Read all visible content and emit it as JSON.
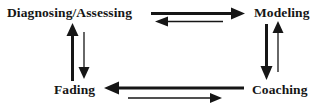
{
  "diagram": {
    "title": "",
    "type": "cycle-diagram",
    "background_color": "#ffffff",
    "ink_color": "#161616",
    "nodes": [
      {
        "id": "diagnosing",
        "label": "Diagnosing/Assessing",
        "position": "top-left"
      },
      {
        "id": "modeling",
        "label": "Modeling",
        "position": "top-right"
      },
      {
        "id": "coaching",
        "label": "Coaching",
        "position": "bottom-right"
      },
      {
        "id": "fading",
        "label": "Fading",
        "position": "bottom-left"
      }
    ],
    "edges": [
      {
        "id": "top-forward",
        "from": "diagnosing",
        "to": "modeling",
        "direction": "right",
        "weight": "thick",
        "side": "top"
      },
      {
        "id": "top-reverse",
        "from": "modeling",
        "to": "diagnosing",
        "direction": "left",
        "weight": "thin",
        "side": "top"
      },
      {
        "id": "right-forward",
        "from": "modeling",
        "to": "coaching",
        "direction": "down",
        "weight": "thick",
        "side": "right"
      },
      {
        "id": "right-reverse",
        "from": "coaching",
        "to": "modeling",
        "direction": "up",
        "weight": "thin",
        "side": "right"
      },
      {
        "id": "bottom-forward",
        "from": "coaching",
        "to": "fading",
        "direction": "left",
        "weight": "thick",
        "side": "bottom"
      },
      {
        "id": "bottom-reverse",
        "from": "fading",
        "to": "coaching",
        "direction": "right",
        "weight": "thin",
        "side": "bottom"
      },
      {
        "id": "left-forward",
        "from": "fading",
        "to": "diagnosing",
        "direction": "up",
        "weight": "thick",
        "side": "left"
      },
      {
        "id": "left-reverse",
        "from": "diagnosing",
        "to": "fading",
        "direction": "down",
        "weight": "thin",
        "side": "left"
      }
    ]
  }
}
